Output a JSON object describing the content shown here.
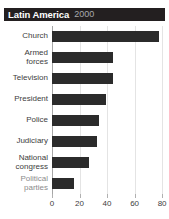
{
  "header": {
    "region": "Latin America",
    "year": "2000"
  },
  "colors": {
    "bar": "#2b2b2b",
    "title_bar": "#231f20",
    "title_text": "#ffffff",
    "year_text": "#a7a9ac",
    "gridline": "#e4e4e4",
    "axis": "#a6a6a6",
    "label": "#404040",
    "label_muted": "#8c8c8c"
  },
  "chart_data": {
    "type": "bar",
    "orientation": "horizontal",
    "title": "Latin America",
    "subtitle": "2000",
    "xlabel": "",
    "ylabel": "",
    "xlim": [
      0,
      85
    ],
    "xticks": [
      0,
      20,
      40,
      60,
      80
    ],
    "xtick_labels": [
      "0",
      "20",
      "40",
      "60",
      "80"
    ],
    "grid": true,
    "legend": false,
    "categories": [
      "Church",
      "Armed\nforces",
      "Television",
      "President",
      "Police",
      "Judiciary",
      "National\ncongress",
      "Political\nparties"
    ],
    "values": [
      78,
      44,
      44,
      39,
      34,
      33,
      27,
      16
    ]
  }
}
